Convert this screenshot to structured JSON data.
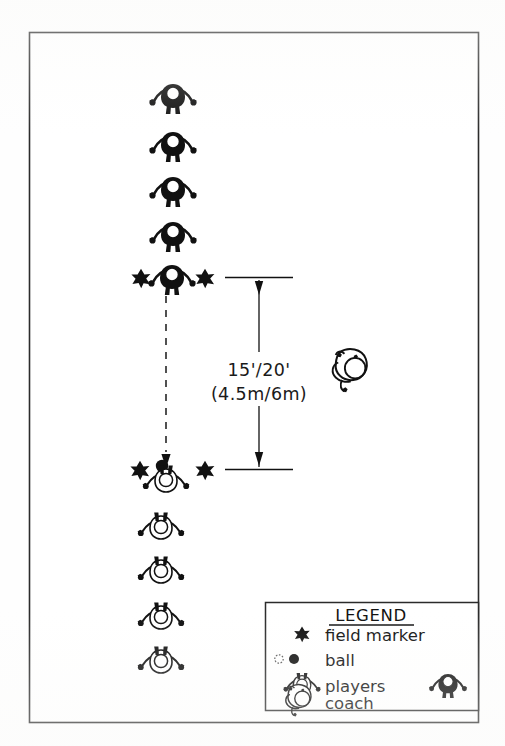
{
  "diagram": {
    "type": "sports-drill-field-diagram",
    "colors": {
      "ink": "#111111",
      "paper": "#ffffff",
      "frame": "#2b2b2b",
      "dashed_line": "#333333"
    },
    "frame": {
      "x": 29,
      "y": 32,
      "width": 449,
      "height": 690
    },
    "distance_label": {
      "imperial": "15'/20'",
      "metric": "(4.5m/6m)",
      "x": 259,
      "y_imperial": 368,
      "y_metric": 393
    },
    "dimension_line": {
      "top_y": 277,
      "bottom_y": 470,
      "x": 259,
      "tick_left": 225,
      "tick_right": 293
    },
    "motion_arrow": {
      "from_x": 166,
      "from_y": 293,
      "to_x": 166,
      "to_y": 466,
      "style": "dashed-with-arrowhead"
    },
    "top_column_players": [
      {
        "x": 173,
        "y": 99,
        "fill": "dark"
      },
      {
        "x": 173,
        "y": 147,
        "fill": "dark"
      },
      {
        "x": 173,
        "y": 192,
        "fill": "dark"
      },
      {
        "x": 173,
        "y": 236,
        "fill": "dark"
      },
      {
        "x": 173,
        "y": 279,
        "fill": "dark"
      }
    ],
    "bottom_column_players": [
      {
        "x": 166,
        "y": 479,
        "fill": "light"
      },
      {
        "x": 161,
        "y": 527,
        "fill": "light"
      },
      {
        "x": 161,
        "y": 570,
        "fill": "light"
      },
      {
        "x": 161,
        "y": 616,
        "fill": "light"
      },
      {
        "x": 161,
        "y": 660,
        "fill": "light"
      }
    ],
    "field_markers": [
      {
        "x": 141,
        "y": 278
      },
      {
        "x": 205,
        "y": 278
      },
      {
        "x": 140,
        "y": 470
      },
      {
        "x": 205,
        "y": 470
      }
    ],
    "ball": {
      "x": 162,
      "y": 465,
      "style": "filled-circle"
    },
    "coach": {
      "x": 352,
      "y": 370,
      "label": "coach"
    }
  },
  "legend": {
    "title": "LEGEND",
    "box": {
      "x": 265,
      "y": 602,
      "width": 213,
      "height": 108
    },
    "rows": [
      {
        "label": "field marker",
        "icon": "field-marker-star-icon"
      },
      {
        "label": "ball",
        "icon": "ball-icon"
      },
      {
        "label": "players",
        "icon": "player-figure-icon"
      },
      {
        "label": "coach",
        "icon": "coach-figure-icon"
      }
    ]
  }
}
